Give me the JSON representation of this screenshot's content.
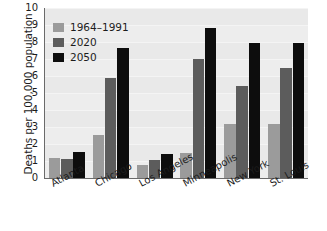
{
  "chart_data": {
    "type": "bar",
    "title": "",
    "xlabel": "",
    "ylabel": "Deaths per 100,000 population",
    "ylim": [
      0,
      10
    ],
    "yticks": [
      0,
      1,
      2,
      3,
      4,
      5,
      6,
      7,
      8,
      9,
      10
    ],
    "grid": true,
    "legend_position": "top-left",
    "categories": [
      "Atlanta",
      "Chicago",
      "Los Angeles",
      "Minneapolis",
      "New York",
      "St. Louis"
    ],
    "series": [
      {
        "name": "1964–1991",
        "color": "#9b9b9b",
        "values": [
          1.2,
          2.55,
          0.75,
          1.5,
          3.2,
          3.15
        ]
      },
      {
        "name": "2020",
        "color": "#5c5c5c",
        "values": [
          1.1,
          5.9,
          1.05,
          7.0,
          5.4,
          6.5
        ]
      },
      {
        "name": "2050",
        "color": "#0d0d0d",
        "values": [
          1.55,
          7.65,
          1.4,
          8.8,
          7.95,
          7.95
        ]
      }
    ]
  },
  "colors": {
    "plot_background": "#e9e9e9",
    "axis": "#6a6a6a",
    "gridline": "#f4f4f4",
    "text": "#1c1c1c",
    "page_background": "#ffffff"
  }
}
